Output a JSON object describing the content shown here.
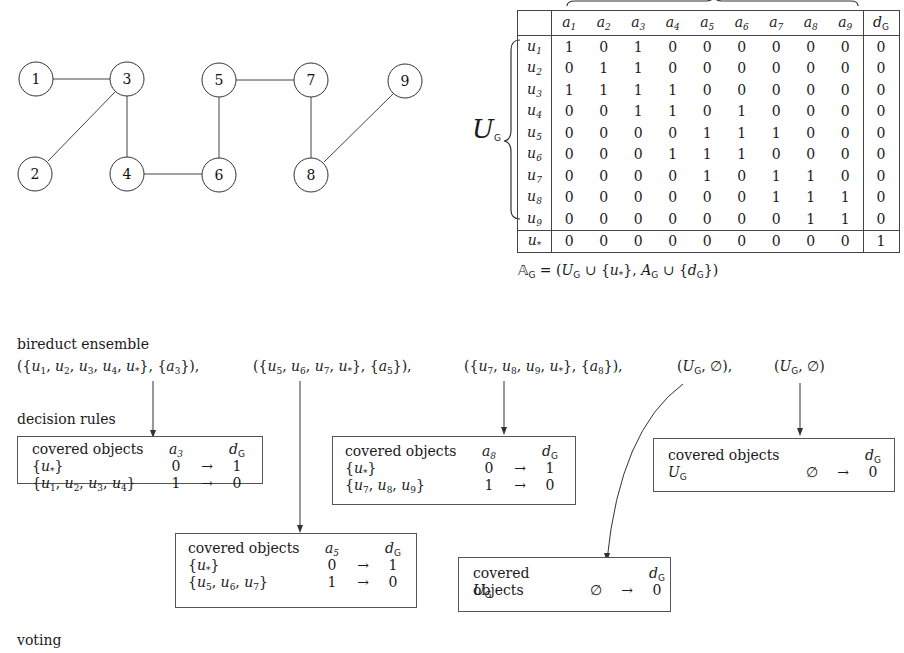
{
  "graph": {
    "nodes": [
      {
        "id": "1",
        "x": 36,
        "y": 79
      },
      {
        "id": "3",
        "x": 127,
        "y": 79
      },
      {
        "id": "5",
        "x": 219,
        "y": 80
      },
      {
        "id": "7",
        "x": 311,
        "y": 80
      },
      {
        "id": "9",
        "x": 405,
        "y": 81
      },
      {
        "id": "2",
        "x": 35,
        "y": 174
      },
      {
        "id": "4",
        "x": 127,
        "y": 174
      },
      {
        "id": "6",
        "x": 219,
        "y": 175
      },
      {
        "id": "8",
        "x": 311,
        "y": 175
      }
    ],
    "edges": [
      [
        "1",
        "3"
      ],
      [
        "2",
        "3"
      ],
      [
        "3",
        "4"
      ],
      [
        "4",
        "6"
      ],
      [
        "5",
        "6"
      ],
      [
        "5",
        "7"
      ],
      [
        "7",
        "8"
      ],
      [
        "8",
        "9"
      ]
    ]
  },
  "decision_table": {
    "row_group_label": "U",
    "row_group_sub": "G",
    "columns": [
      "a1",
      "a2",
      "a3",
      "a4",
      "a5",
      "a6",
      "a7",
      "a8",
      "a9"
    ],
    "decision_column": "d",
    "decision_sub": "G",
    "rows": [
      {
        "obj": "u",
        "sub": "1",
        "values": [
          "1",
          "0",
          "1",
          "0",
          "0",
          "0",
          "0",
          "0",
          "0"
        ],
        "d": "0"
      },
      {
        "obj": "u",
        "sub": "2",
        "values": [
          "0",
          "1",
          "1",
          "0",
          "0",
          "0",
          "0",
          "0",
          "0"
        ],
        "d": "0"
      },
      {
        "obj": "u",
        "sub": "3",
        "values": [
          "1",
          "1",
          "1",
          "1",
          "0",
          "0",
          "0",
          "0",
          "0"
        ],
        "d": "0"
      },
      {
        "obj": "u",
        "sub": "4",
        "values": [
          "0",
          "0",
          "1",
          "1",
          "0",
          "1",
          "0",
          "0",
          "0"
        ],
        "d": "0"
      },
      {
        "obj": "u",
        "sub": "5",
        "values": [
          "0",
          "0",
          "0",
          "0",
          "1",
          "1",
          "1",
          "0",
          "0"
        ],
        "d": "0"
      },
      {
        "obj": "u",
        "sub": "6",
        "values": [
          "0",
          "0",
          "0",
          "1",
          "1",
          "1",
          "0",
          "0",
          "0"
        ],
        "d": "0"
      },
      {
        "obj": "u",
        "sub": "7",
        "values": [
          "0",
          "0",
          "0",
          "0",
          "1",
          "0",
          "1",
          "1",
          "0"
        ],
        "d": "0"
      },
      {
        "obj": "u",
        "sub": "8",
        "values": [
          "0",
          "0",
          "0",
          "0",
          "0",
          "0",
          "1",
          "1",
          "1"
        ],
        "d": "0"
      },
      {
        "obj": "u",
        "sub": "9",
        "values": [
          "0",
          "0",
          "0",
          "0",
          "0",
          "0",
          "0",
          "1",
          "1"
        ],
        "d": "0"
      }
    ],
    "star_row": {
      "obj": "u",
      "sub": "*",
      "values": [
        "0",
        "0",
        "0",
        "0",
        "0",
        "0",
        "0",
        "0",
        "0"
      ],
      "d": "1"
    },
    "caption": "𝔸_G = (U_G ∪ {u*}, A_G ∪ {d_G})"
  },
  "labels": {
    "ensemble": "bireduct ensemble",
    "rules": "decision rules",
    "voting": "voting"
  },
  "bireducts": [
    "({u1, u2, u3, u4, u*}, {a3}),",
    "({u5, u6, u7, u*}, {a5}),",
    "({u7, u8, u9, u*}, {a8}),",
    "(U_G, ∅),",
    "(U_G, ∅)"
  ],
  "rule_boxes": [
    {
      "header": "covered objects",
      "attr": "a3",
      "decision": "dG",
      "rows": [
        {
          "objs": "{u*}",
          "val": "0",
          "arrow": "→",
          "dec": "1"
        },
        {
          "objs": "{u1, u2, u3, u4}",
          "val": "1",
          "arrow": "→",
          "dec": "0"
        }
      ]
    },
    {
      "header": "covered objects",
      "attr": "a5",
      "decision": "dG",
      "rows": [
        {
          "objs": "{u*}",
          "val": "0",
          "arrow": "→",
          "dec": "1"
        },
        {
          "objs": "{u5, u6, u7}",
          "val": "1",
          "arrow": "→",
          "dec": "0"
        }
      ]
    },
    {
      "header": "covered objects",
      "attr": "a8",
      "decision": "dG",
      "rows": [
        {
          "objs": "{u*}",
          "val": "0",
          "arrow": "→",
          "dec": "1"
        },
        {
          "objs": "{u7, u8, u9}",
          "val": "1",
          "arrow": "→",
          "dec": "0"
        }
      ]
    },
    {
      "header": "covered objects",
      "attr": "",
      "decision": "dG",
      "rows": [
        {
          "objs": "UG",
          "val": "∅",
          "arrow": "→",
          "dec": "0"
        }
      ]
    },
    {
      "header": "covered objects",
      "attr": "",
      "decision": "dG",
      "rows": [
        {
          "objs": "UG",
          "val": "∅",
          "arrow": "→",
          "dec": "0"
        }
      ]
    }
  ]
}
